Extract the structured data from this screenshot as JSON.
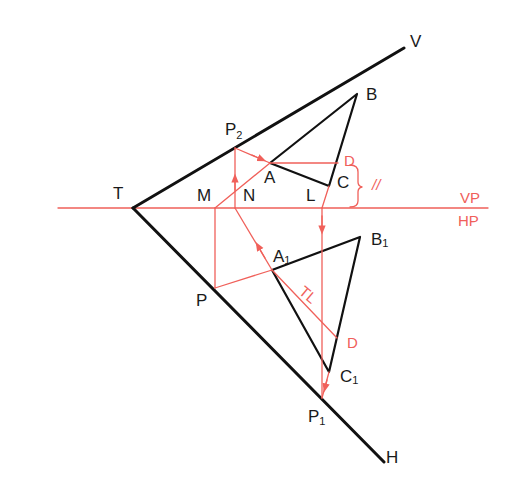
{
  "diagram": {
    "type": "orthographic-projection-traces",
    "colors": {
      "construction": "#f0605a",
      "object": "#111111",
      "background": "#ffffff"
    },
    "labels": {
      "T": "T",
      "V": "V",
      "H": "H",
      "P2": "P",
      "P2_sub": "2",
      "P": "P",
      "P1": "P",
      "P1_sub": "1",
      "M": "M",
      "N": "N",
      "L": "L",
      "A": "A",
      "B": "B",
      "C": "C",
      "A1": "A",
      "A1_sub": "1",
      "B1": "B",
      "B1_sub": "1",
      "C1": "C",
      "C1_sub": "1",
      "D_top": "D",
      "D_bottom": "D",
      "TL": "TL",
      "parallel": "//",
      "VP": "VP",
      "HP": "HP"
    },
    "lines": {
      "xy_line": "VP/HP reference line",
      "vt": "Vertical trace T–V",
      "ht": "Horizontal trace T–H"
    }
  }
}
